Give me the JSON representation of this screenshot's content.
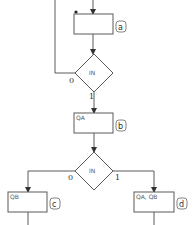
{
  "diagram": {
    "type": "flowchart",
    "steps": [
      {
        "id": "a",
        "tag": "a",
        "text": ""
      },
      {
        "id": "b",
        "tag": "b",
        "text": "QA"
      },
      {
        "id": "c",
        "tag": "c",
        "text": "QB"
      },
      {
        "id": "d",
        "tag": "d",
        "text": "QA, QB"
      }
    ],
    "decisions": [
      {
        "id": "dec1",
        "text": "IN",
        "branch_left": "0",
        "branch_down": "1"
      },
      {
        "id": "dec2",
        "text": "IN",
        "branch_left": "0",
        "branch_right": "1"
      }
    ],
    "colors": {
      "line": "#5a5a5a",
      "background": "#ffffff"
    }
  }
}
